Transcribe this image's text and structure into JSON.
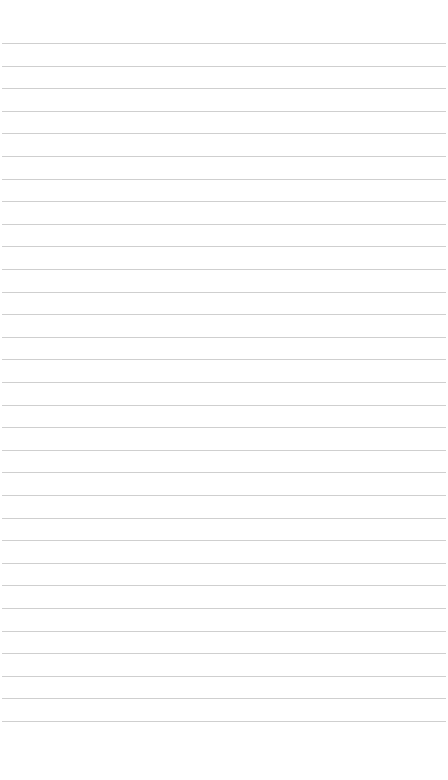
{
  "page": {
    "type": "lined-paper",
    "background_color": "#ffffff",
    "rule_color": "#cfcfcf",
    "rule_count": 31,
    "first_rule_y": 43,
    "rule_spacing": 22.6,
    "rule_left": 2,
    "rule_right": 446
  }
}
